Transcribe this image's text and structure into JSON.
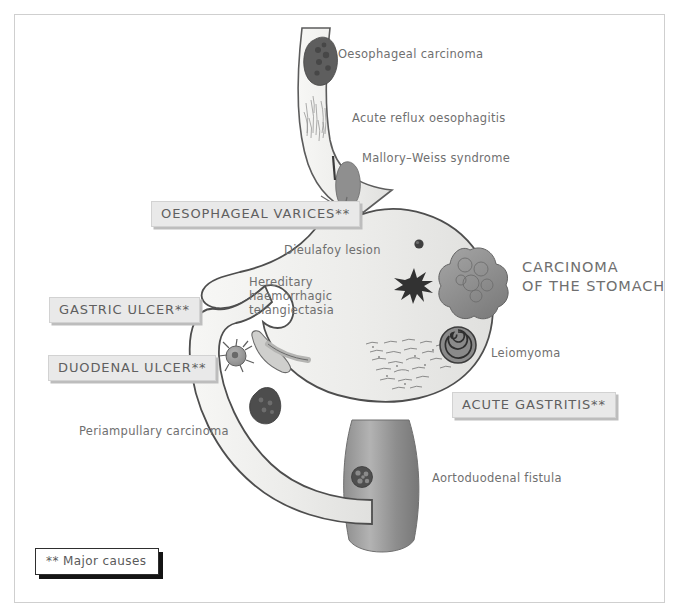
{
  "figure": {
    "title_absent": true,
    "frame_color": "#cfcfcf",
    "label_box_bg": "#e9e9e8",
    "text_color": "#6f6f6f"
  },
  "plain_labels": [
    {
      "id": "oesophageal-carcinoma",
      "text": "Oesophageal carcinoma"
    },
    {
      "id": "acute-reflux-oesophagitis",
      "text": "Acute reflux oesophagitis"
    },
    {
      "id": "mallory-weiss-syndrome",
      "text": "Mallory–Weiss syndrome"
    },
    {
      "id": "dieulafoy-lesion",
      "text": "Dieulafoy  lesion"
    },
    {
      "id": "leiomyoma",
      "text": "Leiomyoma"
    },
    {
      "id": "periampullary-carcinoma",
      "text": "Periampullary  carcinoma"
    },
    {
      "id": "aortoduodenal-fistula",
      "text": "Aortoduodenal fistula"
    }
  ],
  "wrapped_labels": [
    {
      "id": "hereditary-haemorrhagic-telangiectasia",
      "line1": "Hereditary haemorrhagic",
      "line2": "telangiectasia"
    },
    {
      "id": "carcinoma-of-the-stomach",
      "line1": "CARCINOMA",
      "line2": "OF THE STOMACH"
    }
  ],
  "boxed_labels": [
    {
      "id": "oesophageal-varices",
      "text": "OESOPHAGEAL VARICES**"
    },
    {
      "id": "gastric-ulcer",
      "text": "GASTRIC ULCER**"
    },
    {
      "id": "duodenal-ulcer",
      "text": "DUODENAL ULCER**"
    },
    {
      "id": "acute-gastritis",
      "text": "ACUTE GASTRITIS**"
    }
  ],
  "legend": {
    "text": "** Major causes"
  },
  "anatomy": {
    "oesophagus": "oesophagus-tube",
    "stomach": "stomach-body",
    "duodenum": "duodenum-c-loop",
    "aorta": "aorta-cylinder"
  }
}
